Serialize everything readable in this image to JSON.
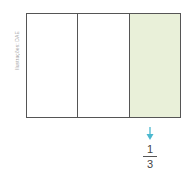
{
  "credit": "Ilustrações: DAE",
  "diagram": {
    "parts": 3,
    "shaded_index": 2,
    "shade_color": "#e9f0d9",
    "arrow_color": "#4bb8cf",
    "fraction": {
      "numerator": "1",
      "denominator": "3"
    }
  }
}
